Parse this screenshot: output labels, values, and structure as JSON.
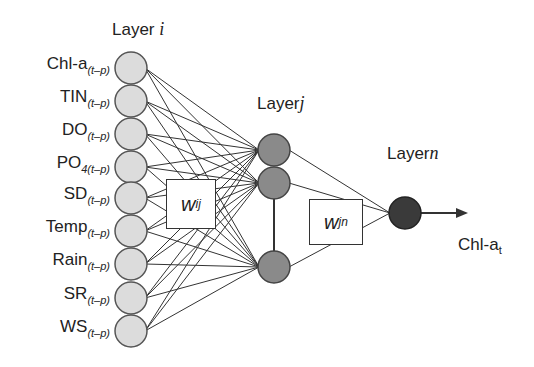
{
  "diagram": {
    "type": "neural-network",
    "layers": {
      "input": {
        "title": "Layer",
        "index": "i"
      },
      "hidden": {
        "title": "Layer",
        "index": "j"
      },
      "output": {
        "title": "Layer",
        "index": "n"
      }
    },
    "inputs": [
      {
        "name": "Chl-a",
        "sub": "(t–p)"
      },
      {
        "name": "TIN",
        "sub": "(t–p)"
      },
      {
        "name": "DO",
        "sub": "(t–p)"
      },
      {
        "name": "PO",
        "sub": "4(t–p)"
      },
      {
        "name": "SD",
        "sub": "(t–p)"
      },
      {
        "name": "Temp",
        "sub": "(t–p)"
      },
      {
        "name": "Rain",
        "sub": "(t–p)"
      },
      {
        "name": "SR",
        "sub": "(t–p)"
      },
      {
        "name": "WS",
        "sub": "(t–p)"
      }
    ],
    "weights": {
      "input_hidden": {
        "base": "w",
        "sub": "ij"
      },
      "hidden_output": {
        "base": "w",
        "sub": "jn"
      }
    },
    "output": {
      "name": "Chl-a",
      "sub": "t"
    },
    "colors": {
      "input_node": "#dcdcdc",
      "hidden_node": "#8a8a8a",
      "output_node": "#3a3a3a",
      "stroke": "#333333"
    }
  }
}
